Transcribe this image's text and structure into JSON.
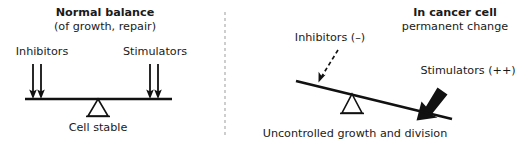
{
  "figure": {
    "divider": {
      "name": "panel-divider",
      "style": "dashed-vertical",
      "color": "#b9b9b9"
    }
  },
  "left_panel": {
    "heading": "Normal balance",
    "subheading": "(of growth, repair)",
    "left_label": "Inhibitors",
    "right_label": "Stimulators",
    "caption": "Cell stable",
    "fulcrum": "open-triangle",
    "beam_state": "level",
    "left_arrows": {
      "count": 2,
      "style": "thin-down-arrow"
    },
    "right_arrows": {
      "count": 2,
      "style": "thin-down-arrow"
    }
  },
  "right_panel": {
    "heading": "In cancer cell",
    "subheading": "permanent change",
    "left_label": "Inhibitors (–)",
    "right_label": "Stimulators (++)",
    "caption": "Uncontrolled growth and division",
    "fulcrum": "open-triangle",
    "beam_state": "tilted-right-down",
    "left_arrow": {
      "count": 1,
      "style": "dashed-diagonal-arrow"
    },
    "right_arrow": {
      "count": 1,
      "style": "bold-thick-diagonal-arrow"
    }
  },
  "colors": {
    "ink": "#111111",
    "text": "#1a1a1a",
    "background": "#ffffff",
    "divider": "#b9b9b9"
  }
}
